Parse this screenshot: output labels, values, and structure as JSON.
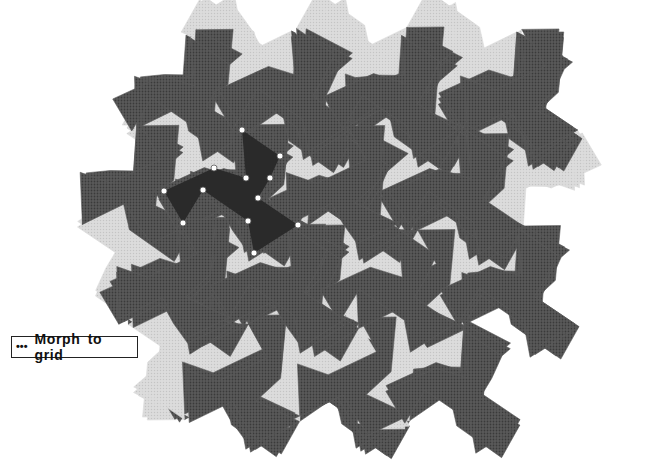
{
  "button": {
    "dots": "•••",
    "label": "Morph to grid"
  },
  "colors": {
    "light_fill": "#dcdcdc",
    "light_dot": "#c4c4c4",
    "dark_fill": "#5a5a5a",
    "dark_dot": "#3a3a3a",
    "selected_fill": "#2a2a2a",
    "handle_fill": "#ffffff",
    "handle_stroke": "#555555"
  },
  "tiling": {
    "selected_tile": [
      [
        242,
        130
      ],
      [
        280,
        156
      ],
      [
        270,
        178
      ],
      [
        258,
        198
      ],
      [
        298,
        225
      ],
      [
        254,
        253
      ],
      [
        248,
        221
      ],
      [
        203,
        190
      ],
      [
        183,
        223
      ],
      [
        164,
        191
      ],
      [
        214,
        168
      ],
      [
        246,
        178
      ]
    ],
    "pinwheel_vertex_indices": [
      0,
      4,
      8
    ],
    "rotation_deg": 60,
    "region": {
      "cx": 365,
      "cy": 232,
      "rx": 232,
      "ry": 205
    }
  }
}
